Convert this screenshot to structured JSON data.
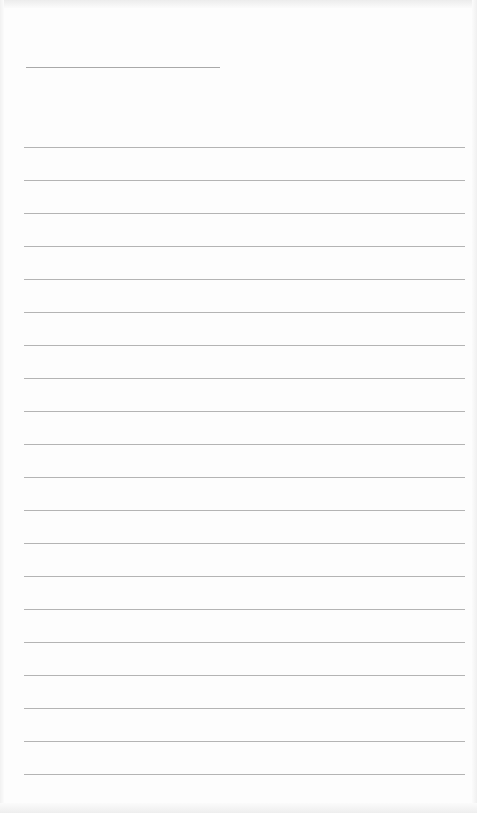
{
  "page": {
    "type": "lined-notepad",
    "background_color": "#fdfdfd",
    "line_color": "#b4b4b4",
    "header_line": {
      "top": 67,
      "left": 26,
      "width": 194
    },
    "rules": {
      "count": 20,
      "first_top": 147,
      "spacing": 33,
      "left": 24,
      "width": 441
    }
  }
}
